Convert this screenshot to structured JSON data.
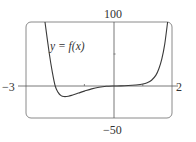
{
  "chart_data": {
    "type": "line",
    "title": "",
    "xlabel": "",
    "ylabel": "",
    "xlim": [
      -3,
      2
    ],
    "ylim": [
      -50,
      100
    ],
    "grid": false,
    "legend": "none",
    "tick_labels": {
      "x_min": "−3",
      "x_max": "2",
      "y_max": "100",
      "y_min": "−50"
    },
    "minor_ticks": {
      "x": [
        -1,
        1
      ],
      "y": [
        50
      ]
    },
    "annotation": "y = f(x)",
    "series": [
      {
        "name": "y = f(x)",
        "x": [
          -2.35,
          -2.2,
          -2.1,
          -2.0,
          -1.9,
          -1.8,
          -1.7,
          -1.55,
          -1.4,
          -1.2,
          -1.0,
          -0.75,
          -0.5,
          -0.25,
          0,
          0.25,
          0.5,
          0.75,
          1.0,
          1.15,
          1.3,
          1.45,
          1.55,
          1.65,
          1.75,
          1.85
        ],
        "y": [
          100,
          50,
          22,
          0,
          -10,
          -15,
          -16.5,
          -16,
          -14,
          -11,
          -8,
          -4.5,
          -2,
          -0.5,
          0,
          0.2,
          0.7,
          1.6,
          3,
          5,
          9,
          17,
          27,
          42,
          65,
          100
        ]
      }
    ]
  },
  "labels": {
    "y_top": "100",
    "y_bottom": "−50",
    "x_left": "−3",
    "x_right": "2",
    "function": "y = f(x)"
  }
}
